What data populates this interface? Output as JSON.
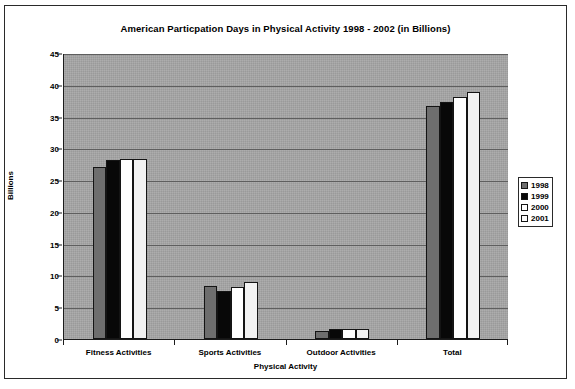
{
  "chart_data": {
    "type": "bar",
    "title": "American Particpation Days in Physical Activity 1998 - 2002 (in Billions)",
    "xlabel": "Physical Activity",
    "ylabel": "Billions",
    "categories": [
      "Fitness Activities",
      "Sports Activities",
      "Outdoor Activities",
      "Total"
    ],
    "series": [
      {
        "name": "1998",
        "color": "#6e6e6e",
        "values": [
          27.1,
          8.3,
          1.3,
          36.7
        ]
      },
      {
        "name": "1999",
        "color": "#080808",
        "values": [
          28.2,
          7.6,
          1.5,
          37.3
        ]
      },
      {
        "name": "2000",
        "color": "#ffffff",
        "values": [
          28.4,
          8.2,
          1.5,
          38.1
        ]
      },
      {
        "name": "2001",
        "color": "#f2f2f2",
        "values": [
          28.4,
          8.9,
          1.5,
          38.8
        ]
      }
    ],
    "ylim": [
      0,
      45
    ],
    "yticks": [
      0,
      5,
      10,
      15,
      20,
      25,
      30,
      35,
      40,
      45
    ],
    "ytick_labels": [
      "0",
      "5",
      "10",
      "15",
      "20",
      "25",
      "30",
      "35",
      "40",
      "45"
    ],
    "grid": "horizontal",
    "legend_position": "right",
    "plot_background": "#9a9a9a",
    "gridline_color": "#5e5e5e"
  }
}
